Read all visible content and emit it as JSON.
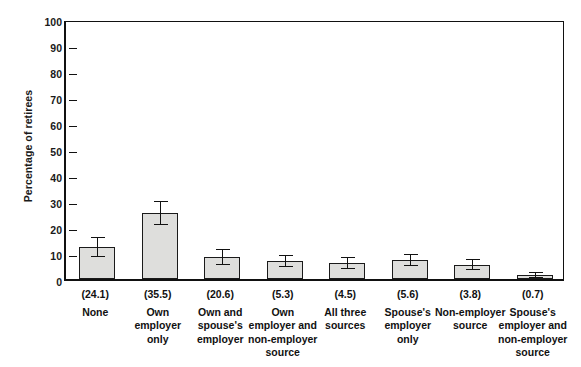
{
  "chart_data": {
    "type": "bar",
    "title": "",
    "xlabel": "",
    "ylabel": "Percentage of retirees",
    "ylim": [
      0,
      100
    ],
    "yticks": [
      0,
      10,
      20,
      30,
      40,
      50,
      60,
      70,
      80,
      90,
      100
    ],
    "grid": false,
    "legend": "none",
    "error_bars": true,
    "categories": [
      "None",
      "Own employer only",
      "Own and spouse's employer",
      "Own employer and non-employer source",
      "All three sources",
      "Spouse's employer only",
      "Non-employer source",
      "Spouse's employer and non-employer source"
    ],
    "category_lines": [
      [
        "None"
      ],
      [
        "Own",
        "employer",
        "only"
      ],
      [
        "Own and",
        "spouse's",
        "employer"
      ],
      [
        "Own",
        "employer and",
        "non-employer",
        "source"
      ],
      [
        "All three",
        "sources"
      ],
      [
        "Spouse's",
        "employer",
        "only"
      ],
      [
        "Non-employer",
        "source"
      ],
      [
        "Spouse's",
        "employer and",
        "non-employer",
        "source"
      ]
    ],
    "secondary_labels": [
      "(24.1)",
      "(35.5)",
      "(20.6)",
      "(5.3)",
      "(4.5)",
      "(5.6)",
      "(3.8)",
      "(0.7)"
    ],
    "values": [
      12.2,
      25.5,
      8.5,
      7.0,
      6.2,
      7.3,
      5.5,
      1.5
    ],
    "errors_upper": [
      3.4,
      4.2,
      2.8,
      2.0,
      1.9,
      2.1,
      1.8,
      0.9
    ],
    "errors_lower": [
      3.4,
      4.2,
      2.8,
      2.0,
      1.9,
      2.1,
      1.8,
      0.9
    ],
    "bar_color": "#dededc",
    "bar_edge_color": "#1a1a1a",
    "error_color": "#111111"
  }
}
